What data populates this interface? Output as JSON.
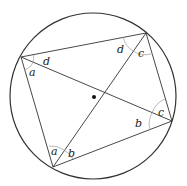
{
  "diagram": {
    "type": "cyclic-quadrilateral",
    "circle": {
      "cx": 93,
      "cy": 96,
      "r": 83
    },
    "center_dot": {
      "x": 94,
      "y": 97
    },
    "vertices": {
      "A": {
        "x": 21,
        "y": 57
      },
      "B": {
        "x": 146,
        "y": 33
      },
      "C": {
        "x": 172,
        "y": 121
      },
      "D": {
        "x": 53,
        "y": 167
      }
    },
    "angle_labels": [
      {
        "text": "a",
        "x": 32,
        "y": 75
      },
      {
        "text": "d",
        "x": 46,
        "y": 64
      },
      {
        "text": "d",
        "x": 118,
        "y": 52
      },
      {
        "text": "c",
        "x": 139,
        "y": 56
      },
      {
        "text": "c",
        "x": 158,
        "y": 116
      },
      {
        "text": "b",
        "x": 135,
        "y": 127
      },
      {
        "text": "a",
        "x": 51,
        "y": 155
      },
      {
        "text": "b",
        "x": 69,
        "y": 157
      }
    ],
    "colors": {
      "line": "#333333",
      "arc": "#999999",
      "background": "#ffffff"
    }
  }
}
